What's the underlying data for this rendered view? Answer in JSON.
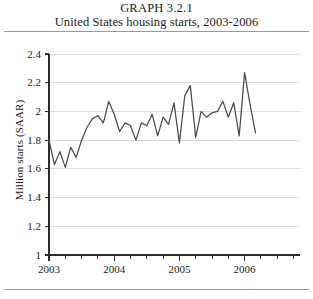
{
  "figure": {
    "label": "GRAPH 3.2.1",
    "caption": "United States housing starts, 2003-2006"
  },
  "colors": {
    "line": "#4a4a4a",
    "grid": "#dcdcdc",
    "axis": "#2b2b2b",
    "rule": "#9a9a9a",
    "text": "#1c1c1c",
    "background": "#ffffff"
  },
  "chart_data": {
    "type": "line",
    "title": "United States housing starts, 2003-2006",
    "subtitle": "GRAPH 3.2.1",
    "xlabel": "",
    "ylabel": "Million starts (SAAR)",
    "xlim": [
      2003.0,
      2006.25
    ],
    "ylim": [
      1.0,
      2.4
    ],
    "ytick_labels": [
      "1",
      "1.2",
      "1.4",
      "1.6",
      "1.8",
      "2",
      "2.2",
      "2.4"
    ],
    "ytick_values": [
      1.0,
      1.2,
      1.4,
      1.6,
      1.8,
      2.0,
      2.2,
      2.4
    ],
    "xtick_labels": [
      "2003",
      "2004",
      "2005",
      "2006"
    ],
    "xtick_values": [
      2003,
      2004,
      2005,
      2006
    ],
    "minor_xticks_per_year": 4,
    "grid": "horizontal",
    "legend": "none",
    "series": [
      {
        "name": "Housing starts (SAAR)",
        "color": "#4a4a4a",
        "x": [
          2003.0,
          2003.083,
          2003.167,
          2003.25,
          2003.333,
          2003.417,
          2003.5,
          2003.583,
          2003.667,
          2003.75,
          2003.833,
          2003.917,
          2004.0,
          2004.083,
          2004.167,
          2004.25,
          2004.333,
          2004.417,
          2004.5,
          2004.583,
          2004.667,
          2004.75,
          2004.833,
          2004.917,
          2005.0,
          2005.083,
          2005.167,
          2005.25,
          2005.333,
          2005.417,
          2005.5,
          2005.583,
          2005.667,
          2005.75,
          2005.833,
          2005.917,
          2006.0,
          2006.083,
          2006.167
        ],
        "values": [
          1.8,
          1.63,
          1.72,
          1.61,
          1.75,
          1.68,
          1.8,
          1.89,
          1.95,
          1.97,
          1.92,
          2.07,
          1.98,
          1.86,
          1.92,
          1.9,
          1.8,
          1.92,
          1.9,
          1.98,
          1.83,
          1.96,
          1.91,
          2.06,
          1.78,
          2.11,
          2.18,
          1.82,
          2.0,
          1.96,
          1.99,
          2.0,
          2.07,
          1.96,
          2.06,
          1.83,
          2.27,
          2.05,
          1.85
        ]
      }
    ]
  }
}
